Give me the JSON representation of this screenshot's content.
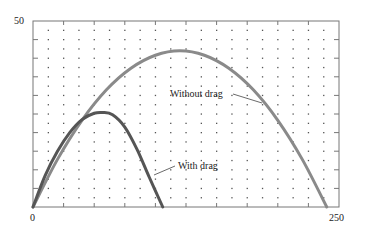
{
  "chart_data": {
    "type": "line",
    "title": "",
    "xlabel": "",
    "ylabel": "",
    "xlim": [
      0,
      250
    ],
    "ylim": [
      0,
      50
    ],
    "x_tick_labels": [
      "0",
      "250"
    ],
    "y_tick_labels": [
      "50"
    ],
    "x_tick_step": 25,
    "y_tick_step": 5,
    "grid": "dotted points",
    "legend": "none (inline annotations)",
    "series": [
      {
        "name": "Without drag",
        "color": "#8a8a8a",
        "x": [
          0,
          20,
          40,
          60,
          80,
          100,
          120,
          140,
          160,
          180,
          200,
          220,
          240
        ],
        "y": [
          0,
          12.8,
          23.3,
          31.5,
          37.3,
          40.8,
          42,
          40.8,
          37.3,
          31.5,
          23.3,
          12.8,
          0
        ]
      },
      {
        "name": "With drag",
        "color": "#555555",
        "x": [
          0,
          10,
          20,
          30,
          40,
          50,
          57,
          65,
          75,
          85,
          95,
          106
        ],
        "y": [
          0,
          8.5,
          15,
          20,
          23.5,
          25.2,
          25.4,
          24.8,
          21.5,
          15.5,
          8,
          0
        ]
      }
    ],
    "annotations": [
      {
        "text": "Without drag",
        "x": 150,
        "y": 37
      },
      {
        "text": "With drag",
        "x": 120,
        "y": 11
      }
    ]
  }
}
